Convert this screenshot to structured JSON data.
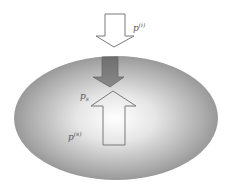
{
  "diagram": {
    "labels": {
      "incident": {
        "base": "p",
        "sup": "(i)"
      },
      "surface": {
        "base": "p",
        "sub": "s"
      },
      "scattered": {
        "base": "p",
        "sup": "(s)"
      }
    },
    "colors": {
      "background": "#ffffff",
      "ellipse_center": "#ffffff",
      "ellipse_edge": "#8a8a8a",
      "arrow_outline": "#7a7a7a",
      "arrow_dark_fill": "#7d7d7d",
      "arrow_light_fill": "#ffffff"
    }
  }
}
